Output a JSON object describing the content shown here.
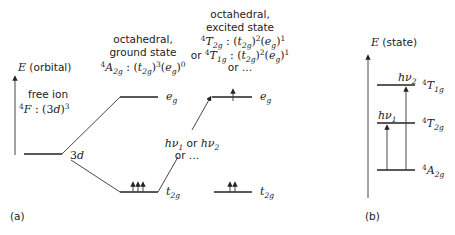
{
  "panel_a": {
    "label": "(a)",
    "axis_label": "E (orbital)",
    "free_ion": {
      "title": "free ion",
      "term": "4F : (3d)3",
      "level": "3d"
    },
    "ground": {
      "title_line1": "octahedral,",
      "title_line2": "ground state",
      "config": "4A2g : (t2g)3(eg)0",
      "upper_level": "eg",
      "lower_level": "t2g",
      "electrons_t2g": 3,
      "electrons_eg": 0
    },
    "excited": {
      "title_line1": "octahedral,",
      "title_line2": "excited state",
      "config_line1": "4T2g : (t2g)2(eg)1",
      "config_line2": "or 4T1g : (t2g)2(eg)1",
      "config_line3": "or ...",
      "upper_level": "eg",
      "lower_level": "t2g",
      "electrons_t2g": 2,
      "electrons_eg": 1
    },
    "transition": {
      "line1": "hν1 or hν2",
      "line2": "or ..."
    }
  },
  "panel_b": {
    "label": "(b)",
    "axis_label": "E (state)",
    "levels": [
      {
        "term": "4T1g",
        "name": "T1g"
      },
      {
        "term": "4T2g",
        "name": "T2g"
      },
      {
        "term": "4A2g",
        "name": "A2g"
      }
    ],
    "transitions": [
      {
        "label": "hν1",
        "from": "4A2g",
        "to": "4T2g"
      },
      {
        "label": "hν2",
        "from": "4A2g",
        "to": "4T1g"
      }
    ]
  }
}
